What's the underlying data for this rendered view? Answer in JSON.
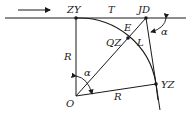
{
  "diagram": {
    "points": {
      "zy": "ZY",
      "jd": "JD",
      "qz": "QZ",
      "yz": "YZ",
      "o": "O"
    },
    "labels": {
      "tangent": "T",
      "external": "E",
      "length": "L",
      "radius_vertical": "R",
      "radius_bottom": "R",
      "alpha_center": "α",
      "alpha_deflection": "α"
    },
    "colors": {
      "line": "#1a1a1a",
      "background": "#ffffff"
    }
  }
}
